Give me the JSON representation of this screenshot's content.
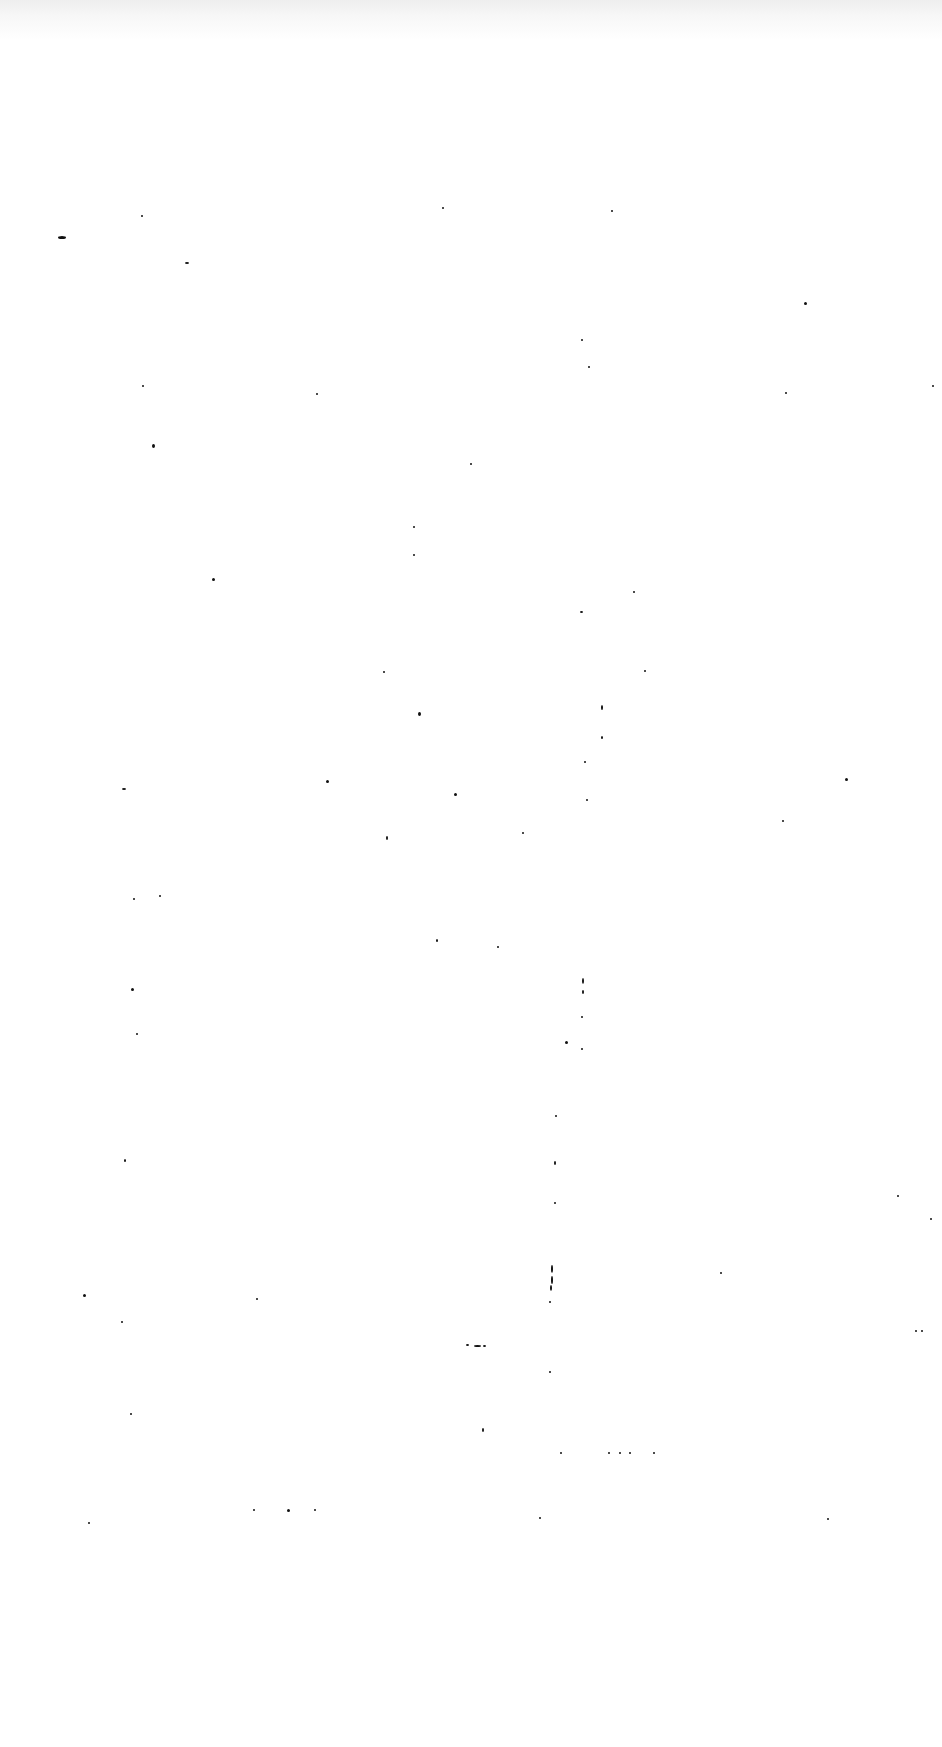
{
  "page": {
    "background": "#ffffff",
    "text": ""
  },
  "specks": [
    [
      58,
      236,
      8,
      3
    ],
    [
      141,
      215,
      2,
      2
    ],
    [
      442,
      207,
      2,
      2
    ],
    [
      611,
      210,
      2,
      2
    ],
    [
      185,
      262,
      4,
      2
    ],
    [
      804,
      302,
      3,
      3
    ],
    [
      581,
      339,
      2,
      2
    ],
    [
      588,
      366,
      2,
      2
    ],
    [
      142,
      385,
      2,
      2
    ],
    [
      316,
      393,
      2,
      2
    ],
    [
      785,
      392,
      2,
      2
    ],
    [
      932,
      385,
      2,
      2
    ],
    [
      152,
      444,
      3,
      4
    ],
    [
      470,
      463,
      2,
      2
    ],
    [
      413,
      526,
      2,
      2
    ],
    [
      413,
      554,
      2,
      2
    ],
    [
      212,
      578,
      3,
      3
    ],
    [
      633,
      591,
      2,
      2
    ],
    [
      580,
      611,
      3,
      2
    ],
    [
      383,
      671,
      2,
      2
    ],
    [
      644,
      670,
      2,
      2
    ],
    [
      418,
      712,
      3,
      4
    ],
    [
      601,
      705,
      2,
      5
    ],
    [
      601,
      736,
      2,
      3
    ],
    [
      584,
      761,
      2,
      2
    ],
    [
      845,
      778,
      3,
      3
    ],
    [
      122,
      788,
      4,
      2
    ],
    [
      326,
      780,
      3,
      3
    ],
    [
      454,
      793,
      3,
      3
    ],
    [
      586,
      799,
      2,
      2
    ],
    [
      522,
      832,
      2,
      2
    ],
    [
      782,
      820,
      2,
      2
    ],
    [
      386,
      836,
      2,
      4
    ],
    [
      133,
      898,
      2,
      2
    ],
    [
      159,
      895,
      2,
      2
    ],
    [
      436,
      939,
      2,
      3
    ],
    [
      497,
      946,
      2,
      2
    ],
    [
      582,
      978,
      2,
      6
    ],
    [
      582,
      990,
      2,
      4
    ],
    [
      131,
      988,
      3,
      3
    ],
    [
      581,
      1016,
      2,
      2
    ],
    [
      565,
      1041,
      3,
      3
    ],
    [
      581,
      1048,
      2,
      2
    ],
    [
      136,
      1033,
      2,
      2
    ],
    [
      124,
      1159,
      2,
      3
    ],
    [
      555,
      1115,
      2,
      2
    ],
    [
      554,
      1161,
      2,
      4
    ],
    [
      554,
      1202,
      2,
      2
    ],
    [
      897,
      1195,
      2,
      2
    ],
    [
      930,
      1218,
      2,
      2
    ],
    [
      83,
      1294,
      3,
      3
    ],
    [
      121,
      1321,
      2,
      2
    ],
    [
      256,
      1298,
      2,
      2
    ],
    [
      720,
      1272,
      2,
      2
    ],
    [
      551,
      1265,
      2,
      8
    ],
    [
      551,
      1276,
      2,
      8
    ],
    [
      550,
      1285,
      2,
      6
    ],
    [
      549,
      1301,
      2,
      2
    ],
    [
      466,
      1344,
      3,
      2
    ],
    [
      474,
      1345,
      7,
      2
    ],
    [
      483,
      1345,
      3,
      2
    ],
    [
      549,
      1371,
      2,
      2
    ],
    [
      915,
      1330,
      2,
      2
    ],
    [
      130,
      1413,
      2,
      2
    ],
    [
      482,
      1428,
      2,
      4
    ],
    [
      560,
      1452,
      2,
      2
    ],
    [
      608,
      1452,
      2,
      2
    ],
    [
      619,
      1452,
      2,
      2
    ],
    [
      629,
      1452,
      2,
      2
    ],
    [
      653,
      1452,
      2,
      2
    ],
    [
      253,
      1509,
      2,
      2
    ],
    [
      287,
      1509,
      3,
      3
    ],
    [
      314,
      1509,
      2,
      2
    ],
    [
      88,
      1522,
      2,
      2
    ],
    [
      539,
      1517,
      2,
      2
    ],
    [
      827,
      1518,
      2,
      2
    ],
    [
      921,
      1330,
      2,
      2
    ]
  ]
}
